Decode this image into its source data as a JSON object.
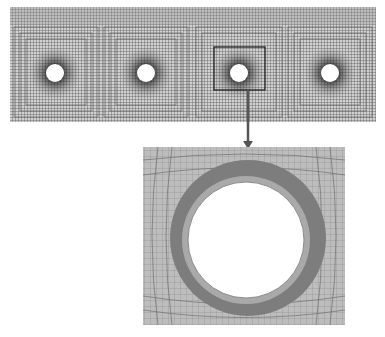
{
  "figure": {
    "type": "finite-element-mesh",
    "overview": {
      "description": "Structured quadrilateral mesh strip with four circular holes",
      "hole_count": 4,
      "holes": [
        {
          "cx": 55,
          "cy": 73,
          "r": 9
        },
        {
          "cx": 146,
          "cy": 73,
          "r": 9
        },
        {
          "cx": 239,
          "cy": 73,
          "r": 9
        },
        {
          "cx": 330,
          "cy": 73,
          "r": 9
        }
      ],
      "highlighted_hole_index": 2
    },
    "detail": {
      "description": "Zoomed view of the mesh around the third hole showing a dark refined band",
      "hole": {
        "cx": 246,
        "cy": 240,
        "r": 58
      },
      "band_outer_r": 78
    },
    "colors": {
      "mesh_line": "#3a3a3a",
      "mesh_bg": "#d6d6d6",
      "detail_bg": "#bdbdbd",
      "detail_line": "#7c7c7c",
      "band": "#7d7d7d",
      "hole": "#ffffff",
      "arrow": "#555555"
    }
  }
}
